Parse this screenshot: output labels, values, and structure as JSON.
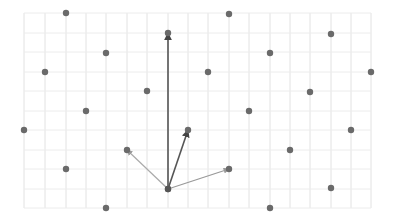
{
  "diagram": {
    "type": "lattice-with-vectors",
    "grid": {
      "x_lines": [
        24,
        45,
        66,
        86,
        106,
        127,
        147,
        168,
        188,
        208,
        229,
        249,
        270,
        290,
        310,
        331,
        351,
        371
      ],
      "y_lines": [
        13,
        33,
        52,
        72,
        91,
        111,
        130,
        150,
        169,
        189,
        208
      ],
      "color": "#e2e2e2"
    },
    "points": [
      [
        66,
        13
      ],
      [
        229,
        14
      ],
      [
        168,
        33
      ],
      [
        331,
        34
      ],
      [
        106,
        53
      ],
      [
        270,
        53
      ],
      [
        45,
        72
      ],
      [
        208,
        72
      ],
      [
        371,
        72
      ],
      [
        147,
        91
      ],
      [
        310,
        92
      ],
      [
        86,
        111
      ],
      [
        249,
        111
      ],
      [
        24,
        130
      ],
      [
        188,
        130
      ],
      [
        351,
        130
      ],
      [
        127,
        150
      ],
      [
        290,
        150
      ],
      [
        66,
        169
      ],
      [
        229,
        169
      ],
      [
        168,
        189
      ],
      [
        331,
        188
      ],
      [
        106,
        208
      ],
      [
        270,
        208
      ]
    ],
    "point_color": "#6a6a6a",
    "origin": [
      168,
      189
    ],
    "vectors": [
      {
        "to": [
          168,
          33
        ],
        "color": "#555555",
        "width": 1.6
      },
      {
        "to": [
          188,
          130
        ],
        "color": "#555555",
        "width": 1.6
      },
      {
        "to": [
          127,
          150
        ],
        "color": "#aaaaaa",
        "width": 1.2
      },
      {
        "to": [
          229,
          169
        ],
        "color": "#999999",
        "width": 1.2
      }
    ]
  }
}
